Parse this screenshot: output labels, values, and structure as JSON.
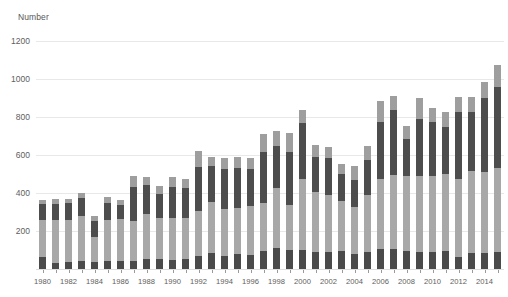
{
  "chart_data": {
    "type": "bar",
    "subtype": "stacked",
    "title": "",
    "xlabel": "",
    "ylabel": "Number",
    "ylim": [
      0,
      1200
    ],
    "ytick_values": [
      0,
      200,
      400,
      600,
      800,
      1000,
      1200
    ],
    "ytick_labels": [
      "0",
      "200",
      "400",
      "600",
      "800",
      "1000",
      "1200"
    ],
    "ytick_labels_shown": [
      "200",
      "400",
      "600",
      "800",
      "1000",
      "1200"
    ],
    "grid": true,
    "grid_axis": "y",
    "legend": "none",
    "categories": [
      "1980",
      "1981",
      "1982",
      "1983",
      "1984",
      "1985",
      "1986",
      "1987",
      "1988",
      "1989",
      "1990",
      "1991",
      "1992",
      "1993",
      "1994",
      "1995",
      "1996",
      "1997",
      "1998",
      "1999",
      "2000",
      "2001",
      "2002",
      "2003",
      "2004",
      "2005",
      "2006",
      "2007",
      "2008",
      "2009",
      "2010",
      "2011",
      "2012",
      "2013",
      "2014",
      "2015"
    ],
    "xtick_labels": [
      "1980",
      "1982",
      "1984",
      "1986",
      "1988",
      "1990",
      "1992",
      "1994",
      "1996",
      "1998",
      "2000",
      "2002",
      "2004",
      "2006",
      "2008",
      "2010",
      "2012",
      "2014"
    ],
    "series": [
      {
        "name": "segment-1",
        "color": "#4a4a4a",
        "values": [
          62,
          30,
          38,
          42,
          38,
          42,
          42,
          44,
          52,
          54,
          48,
          54,
          66,
          84,
          68,
          78,
          74,
          94,
          112,
          98,
          100,
          92,
          92,
          96,
          80,
          92,
          106,
          104,
          96,
          92,
          92,
          96,
          64,
          86,
          86,
          92
        ]
      },
      {
        "name": "segment-2",
        "color": "#a8a8a8",
        "values": [
          198,
          226,
          222,
          238,
          130,
          218,
          220,
          208,
          238,
          216,
          222,
          216,
          240,
          270,
          248,
          244,
          258,
          256,
          312,
          238,
          376,
          316,
          300,
          264,
          246,
          296,
          368,
          392,
          392,
          396,
          398,
          406,
          412,
          428,
          426,
          442
        ]
      },
      {
        "name": "segment-3",
        "color": "#4d4d4d",
        "values": [
          84,
          88,
          86,
          92,
          86,
          90,
          76,
          178,
          152,
          124,
          164,
          156,
          232,
          186,
          212,
          212,
          196,
          268,
          226,
          282,
          294,
          182,
          190,
          140,
          140,
          184,
          300,
          342,
          196,
          300,
          284,
          244,
          348,
          314,
          388,
          424
        ]
      },
      {
        "name": "segment-4",
        "color": "#9e9e9e",
        "values": [
          22,
          22,
          24,
          26,
          24,
          28,
          26,
          58,
          44,
          42,
          48,
          46,
          84,
          52,
          58,
          58,
          54,
          94,
          78,
          100,
          68,
          64,
          62,
          52,
          76,
          76,
          110,
          72,
          70,
          112,
          76,
          80,
          82,
          78,
          86,
          114
        ]
      }
    ],
    "totals": [
      366,
      366,
      370,
      398,
      278,
      378,
      364,
      488,
      486,
      436,
      482,
      472,
      622,
      592,
      586,
      592,
      582,
      712,
      728,
      718,
      838,
      654,
      644,
      552,
      542,
      648,
      884,
      910,
      754,
      900,
      850,
      826,
      906,
      906,
      986,
      1072
    ]
  }
}
